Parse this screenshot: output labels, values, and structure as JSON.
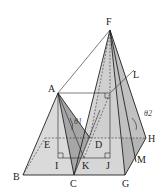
{
  "diagram": {
    "type": "geometry-3d",
    "points": {
      "A": {
        "label": "A",
        "x": 58,
        "y": 93
      },
      "B": {
        "label": "B",
        "x": 23,
        "y": 175
      },
      "C": {
        "label": "C",
        "x": 74,
        "y": 175
      },
      "D": {
        "label": "D",
        "x": 110,
        "y": 145
      },
      "E": {
        "label": "E",
        "x": 45,
        "y": 145
      },
      "F": {
        "label": "F",
        "x": 110,
        "y": 30
      },
      "G": {
        "label": "G",
        "x": 125,
        "y": 175
      },
      "H": {
        "label": "H",
        "x": 146,
        "y": 138
      },
      "I": {
        "label": "I",
        "x": 58,
        "y": 158
      },
      "J": {
        "label": "J",
        "x": 110,
        "y": 158
      },
      "K": {
        "label": "K",
        "x": 84,
        "y": 158
      },
      "L": {
        "label": "L",
        "x": 134,
        "y": 70
      },
      "M": {
        "label": "M",
        "x": 136,
        "y": 162
      }
    },
    "angles": [
      {
        "label": "θ1",
        "at": "K"
      },
      {
        "label": "θ2",
        "at": "M"
      }
    ],
    "colors": {
      "line": "#222222",
      "face_light": "#e2e2e2",
      "face_mid": "#c8c8c8",
      "face_dark": "#a8a8a8"
    }
  }
}
